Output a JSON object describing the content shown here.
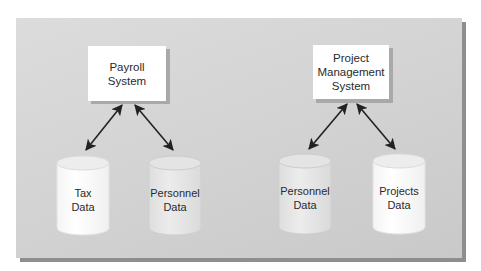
{
  "diagram": {
    "systems": [
      {
        "id": "payroll",
        "label": "Payroll\nSystem"
      },
      {
        "id": "pm",
        "label": "Project\nManagement\nSystem"
      }
    ],
    "data_stores": [
      {
        "id": "tax",
        "label": "Tax\nData",
        "fill": "#ffffff"
      },
      {
        "id": "personnel-1",
        "label": "Personnel\nData",
        "fill": "#e6e6e6"
      },
      {
        "id": "personnel-2",
        "label": "Personnel\nData",
        "fill": "#e6e6e6"
      },
      {
        "id": "projects",
        "label": "Projects\nData",
        "fill": "#ffffff"
      }
    ],
    "connections": [
      {
        "from": "payroll",
        "to": "tax",
        "type": "bidirectional-arrow"
      },
      {
        "from": "payroll",
        "to": "personnel-1",
        "type": "bidirectional-arrow"
      },
      {
        "from": "pm",
        "to": "personnel-2",
        "type": "bidirectional-arrow"
      },
      {
        "from": "pm",
        "to": "projects",
        "type": "bidirectional-arrow"
      }
    ],
    "colors": {
      "panel": "#d4d4d4",
      "panel_shadow": "#8e8e8e",
      "box": "#ffffff",
      "arrow": "#222222"
    }
  }
}
